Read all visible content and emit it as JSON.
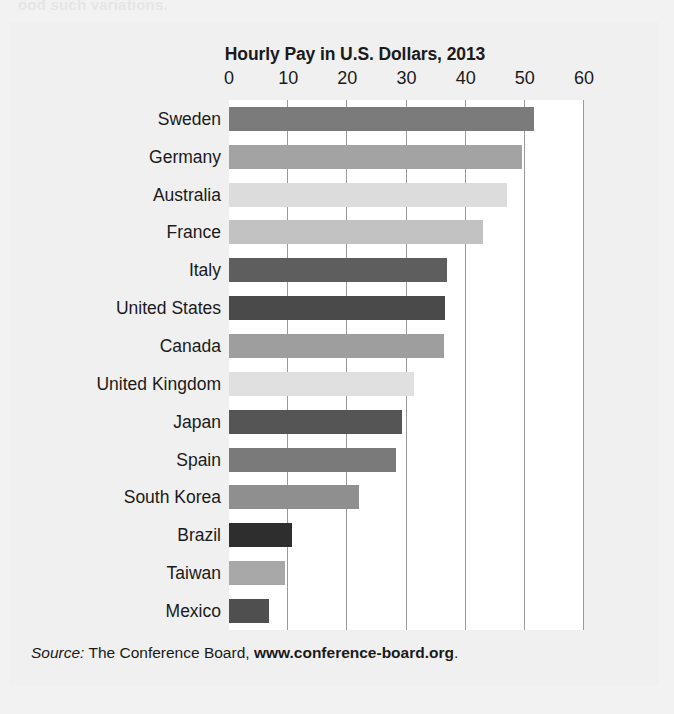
{
  "page": {
    "cropped_top_text": "ood such variations."
  },
  "figure": {
    "source": {
      "label": "Source:",
      "text": " The Conference Board, ",
      "url": "www.conference-board.org",
      "period": "."
    }
  },
  "chart_data": {
    "type": "bar",
    "orientation": "horizontal",
    "title": "Hourly Pay in U.S. Dollars, 2013",
    "xlabel": "",
    "ylabel": "",
    "xlim": [
      0,
      60
    ],
    "xticks": [
      0,
      10,
      20,
      30,
      40,
      50,
      60
    ],
    "xtick_labels": [
      "0",
      "10",
      "20",
      "30",
      "40",
      "50",
      "60"
    ],
    "grid": "vertical",
    "legend": "none",
    "categories": [
      "Sweden",
      "Germany",
      "Australia",
      "France",
      "Italy",
      "United States",
      "Canada",
      "United Kingdom",
      "Japan",
      "Spain",
      "South Korea",
      "Brazil",
      "Taiwan",
      "Mexico"
    ],
    "values": [
      51.5,
      49.5,
      47.0,
      43.0,
      36.8,
      36.5,
      36.3,
      31.2,
      29.2,
      28.2,
      22.0,
      10.7,
      9.5,
      6.8
    ],
    "bar_colors": [
      "#7b7b7b",
      "#a3a3a3",
      "#dcdcdc",
      "#c2c2c2",
      "#5e5e5e",
      "#4a4a4a",
      "#9e9e9e",
      "#e0e0e0",
      "#555555",
      "#7a7a7a",
      "#8f8f8f",
      "#2e2e2e",
      "#a8a8a8",
      "#4f4f4f"
    ],
    "axis_color": "#9a9a9a",
    "plot_background": "#ffffff",
    "figure_background": "#f0f0f0"
  }
}
